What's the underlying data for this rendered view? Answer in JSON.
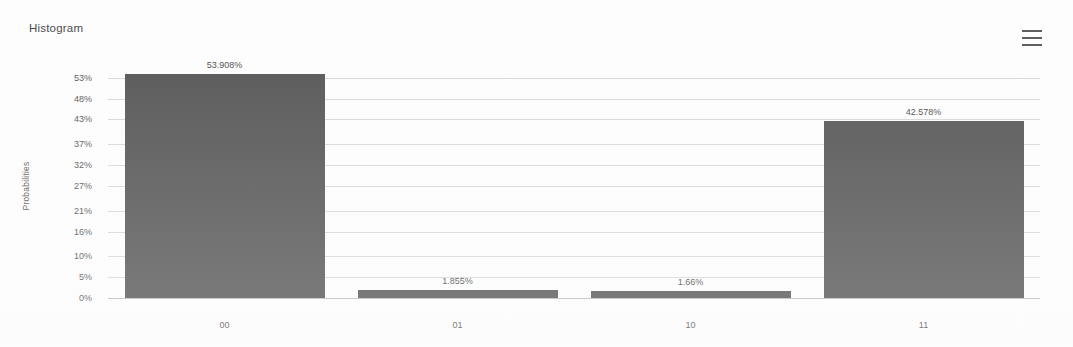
{
  "header": {
    "title": "Histogram",
    "menu_icon": "hamburger-menu-icon"
  },
  "axis": {
    "y_title": "Probabilities",
    "y_ticks": [
      "53%",
      "48%",
      "43%",
      "37%",
      "32%",
      "27%",
      "21%",
      "16%",
      "10%",
      "5%",
      "0%"
    ],
    "x_ticks": [
      "00",
      "01",
      "10",
      "11"
    ]
  },
  "bars": [
    {
      "category": "00",
      "label": "53.908%",
      "value": 53.908
    },
    {
      "category": "01",
      "label": "1.855%",
      "value": 1.855
    },
    {
      "category": "10",
      "label": "1.66%",
      "value": 1.66
    },
    {
      "category": "11",
      "label": "42.578%",
      "value": 42.578
    }
  ],
  "colors": {
    "bar": "#565656",
    "gridline": "#d8d8d8",
    "text": "#565656",
    "background": "#fdfdfd"
  },
  "chart_data": {
    "type": "bar",
    "title": "Histogram",
    "xlabel": "",
    "ylabel": "Probabilities",
    "categories": [
      "00",
      "01",
      "10",
      "11"
    ],
    "values": [
      53.908,
      1.855,
      1.66,
      42.578
    ],
    "data_labels": [
      "53.908%",
      "1.855%",
      "1.66%",
      "42.578%"
    ],
    "ytick_labels": [
      "0%",
      "5%",
      "10%",
      "16%",
      "21%",
      "27%",
      "32%",
      "37%",
      "43%",
      "48%",
      "53%"
    ],
    "ytick_values": [
      0,
      5,
      10,
      16,
      21,
      27,
      32,
      37,
      43,
      48,
      53
    ],
    "ylim": [
      0,
      53.908
    ],
    "grid": true,
    "legend": false,
    "units": "percent"
  }
}
